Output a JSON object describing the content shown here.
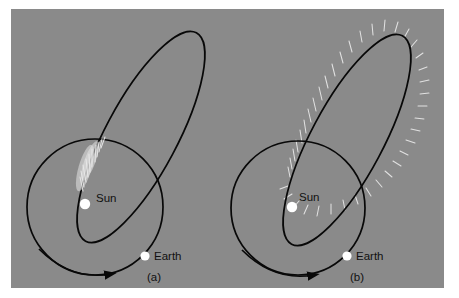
{
  "figure": {
    "kind": "comet-orbit-diagram",
    "background_color": "#8a8a8a",
    "page_color": "#ffffff",
    "line_color": "#080808",
    "body_color": "#ffffff",
    "tail_color": "#e9e9e9",
    "label_color": "#111111"
  },
  "panels": [
    {
      "id": "a",
      "caption": "(a)",
      "sun_label": "Sun",
      "earth_label": "Earth",
      "tail_mode": "near-perihelion-only",
      "tail_description": "Diffuse white tail shown only near perihelion, pointing away from the Sun"
    },
    {
      "id": "b",
      "caption": "(b)",
      "sun_label": "Sun",
      "earth_label": "Earth",
      "tail_mode": "all-along-orbit",
      "tail_description": "Short white tail ticks all along the elliptical orbit, each pointing radially away from the Sun"
    }
  ],
  "elements": {
    "earth_orbit_name": "Earth orbit circle",
    "comet_orbit_name": "Comet elliptical orbit",
    "direction_arrow_name": "Earth orbital direction arrow"
  },
  "geometry": {
    "panel_a": {
      "sun": {
        "cx": 74,
        "cy": 195,
        "r": 5.2
      },
      "earth": {
        "cx": 134,
        "cy": 247,
        "r": 4.6
      },
      "earth_orbit": {
        "cx": 84,
        "cy": 198,
        "r": 68
      },
      "comet_ellipse": {
        "cx": 130,
        "cy": 128,
        "rx": 36,
        "ry": 118,
        "rotate": 28
      }
    },
    "panel_b": {
      "sun": {
        "cx": 281,
        "cy": 198,
        "r": 5.2
      },
      "earth": {
        "cx": 336,
        "cy": 247,
        "r": 4.6
      },
      "earth_orbit": {
        "cx": 287,
        "cy": 199,
        "r": 67
      },
      "comet_ellipse": {
        "cx": 336,
        "cy": 131,
        "rx": 36,
        "ry": 118,
        "rotate": 28
      }
    }
  }
}
